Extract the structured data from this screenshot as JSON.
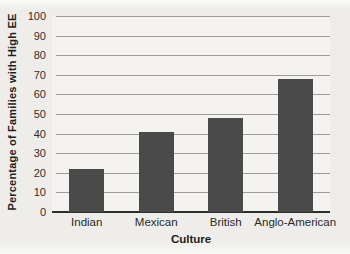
{
  "chart_data": {
    "type": "bar",
    "categories": [
      "Indian",
      "Mexican",
      "British",
      "Anglo-American"
    ],
    "values": [
      22,
      41,
      48,
      68
    ],
    "title": "",
    "xlabel": "Culture",
    "ylabel": "Percentage of Families with High EE",
    "ylim": [
      0,
      100
    ],
    "yticks": [
      0,
      10,
      20,
      30,
      40,
      50,
      60,
      70,
      80,
      90,
      100
    ],
    "grid": "horizontal gridlines at each y tick",
    "legend_position": "none",
    "colors": {
      "bar": "#4a4a4a",
      "gridline": "#9c9c9a",
      "axis_line": "#2d2d2b",
      "text": "#2a2a28",
      "plot_background": "#f4f3f0",
      "page_background": "#eeedea"
    }
  }
}
